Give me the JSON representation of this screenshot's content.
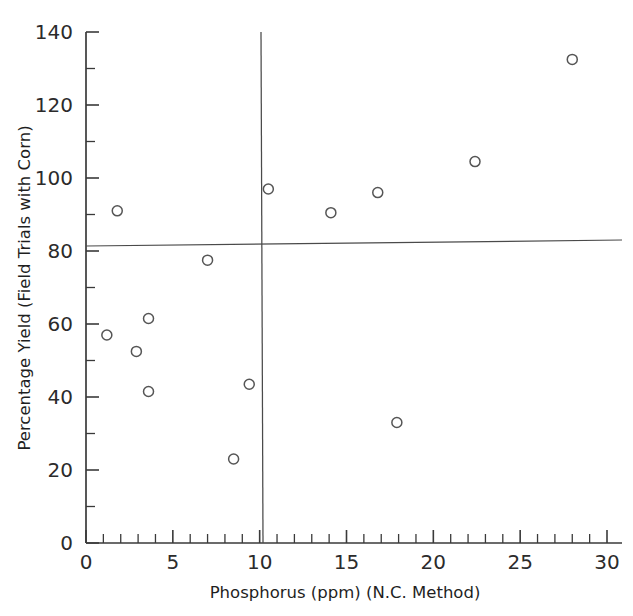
{
  "chart_data": {
    "type": "scatter",
    "title": "",
    "xlabel": "Phosphorus (ppm) (N.C. Method)",
    "ylabel": "Percentage Yield (Field Trials with Corn)",
    "xlim": [
      0,
      30
    ],
    "ylim": [
      0,
      140
    ],
    "grid": false,
    "legend": null,
    "x_major_ticks": [
      0,
      5,
      10,
      15,
      20,
      25,
      30
    ],
    "x_tick_labels": [
      "0",
      "5",
      "10",
      "15",
      "20",
      "25",
      "30"
    ],
    "x_minor_tick_step": 1,
    "y_major_ticks": [
      0,
      20,
      40,
      60,
      80,
      100,
      120,
      140
    ],
    "y_tick_labels": [
      "0",
      "20",
      "40",
      "60",
      "80",
      "100",
      "120",
      "140"
    ],
    "y_minor_tick_step": 10,
    "marker_style": "open-circle",
    "points": [
      {
        "x": 1.2,
        "y": 57
      },
      {
        "x": 1.8,
        "y": 91
      },
      {
        "x": 2.9,
        "y": 52.5
      },
      {
        "x": 3.6,
        "y": 61.5
      },
      {
        "x": 3.6,
        "y": 41.5
      },
      {
        "x": 7.0,
        "y": 77.5
      },
      {
        "x": 8.5,
        "y": 23
      },
      {
        "x": 9.4,
        "y": 43.5
      },
      {
        "x": 10.5,
        "y": 97
      },
      {
        "x": 14.1,
        "y": 90.5
      },
      {
        "x": 16.8,
        "y": 96
      },
      {
        "x": 17.9,
        "y": 33
      },
      {
        "x": 22.4,
        "y": 104.5
      },
      {
        "x": 28.0,
        "y": 132.5
      }
    ],
    "annotations": [
      {
        "name": "vertical-critical-level-line",
        "orientation": "vertical",
        "x": 10.2,
        "y_from": 0,
        "y_to": 140
      },
      {
        "name": "horizontal-yield-reference-line",
        "orientation": "horizontal",
        "x_from": 0,
        "x_to": 30.8,
        "y_at_xmin": 81.5,
        "y_at_xmax": 83.2
      }
    ]
  }
}
